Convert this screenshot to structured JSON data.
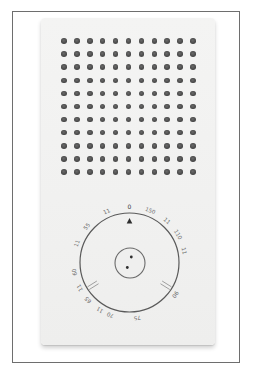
{
  "image": {
    "subject": "Pocket transistor radio (Braun T3 style), front view",
    "frame_color": "#6e6e6e",
    "body_color": "#f2f2f1",
    "grille_dot_color": "#4f4f4f"
  },
  "grille": {
    "columns": 11,
    "rows": 11,
    "origin_x": 64,
    "origin_y": 41,
    "spacing_x": 12.9,
    "spacing_y": 13.1,
    "dot_diameter": 5.5
  },
  "dial": {
    "center_x": 129.5,
    "center_y": 262.5,
    "outer_radius": 49.5,
    "inner_knob_radius": 15,
    "pointer": "triangle-up",
    "scale_labels": [
      {
        "text": "0",
        "angle": 0
      },
      {
        "text": "150",
        "angle": 22
      },
      {
        "text": "11",
        "angle": 42
      },
      {
        "text": "110",
        "angle": 60
      },
      {
        "text": "11",
        "angle": 78
      },
      {
        "text": "90",
        "angle": 125
      },
      {
        "text": "75",
        "angle": 172
      },
      {
        "text": "70",
        "angle": 200
      },
      {
        "text": "11",
        "angle": 212
      },
      {
        "text": "65",
        "angle": 228
      },
      {
        "text": "11",
        "angle": 243
      },
      {
        "text": "60",
        "angle": 260
      },
      {
        "text": "11",
        "angle": 290
      },
      {
        "text": "55",
        "angle": 310
      },
      {
        "text": "11",
        "angle": 336
      }
    ]
  }
}
